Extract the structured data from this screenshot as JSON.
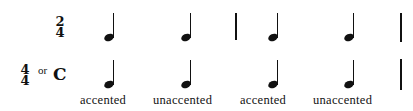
{
  "row1": {
    "time_signature": {
      "top": "2",
      "bottom": "4"
    }
  },
  "row2": {
    "time_signature": {
      "top": "4",
      "bottom": "4"
    },
    "or_text": "or",
    "common_time": "C"
  },
  "notes": {
    "type": "quarter-note",
    "count_per_row": 4
  },
  "labels": [
    "accented",
    "unaccented",
    "accented",
    "unaccented"
  ]
}
